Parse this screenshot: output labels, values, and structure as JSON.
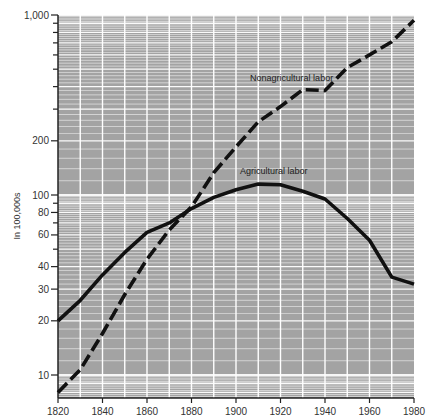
{
  "chart_data": {
    "type": "line",
    "title": "",
    "xlabel": "",
    "ylabel": "In 100,000s",
    "yscale": "log",
    "ylim": [
      7.45,
      1000
    ],
    "xlim": [
      1820,
      1980
    ],
    "grid": true,
    "x": [
      1820,
      1830,
      1840,
      1850,
      1860,
      1870,
      1880,
      1890,
      1900,
      1910,
      1920,
      1930,
      1940,
      1950,
      1960,
      1970,
      1980
    ],
    "x_ticks": [
      1820,
      1840,
      1860,
      1880,
      1900,
      1920,
      1940,
      1960,
      1980
    ],
    "y_ticks": [
      {
        "value": 1000,
        "label": "1,000"
      },
      {
        "value": 200,
        "label": "200"
      },
      {
        "value": 100,
        "label": "100"
      },
      {
        "value": 80,
        "label": "80"
      },
      {
        "value": 60,
        "label": "60"
      },
      {
        "value": 40,
        "label": "40"
      },
      {
        "value": 30,
        "label": "30"
      },
      {
        "value": 20,
        "label": "20"
      },
      {
        "value": 10,
        "label": "10"
      }
    ],
    "y_minor_ticks": [
      900,
      800,
      700,
      600,
      500,
      400,
      300,
      90,
      70,
      50
    ],
    "series": [
      {
        "name": "Nonagricultural labor",
        "style": "dashed",
        "values": [
          8,
          10.7,
          17,
          28,
          44,
          64,
          86,
          133,
          185,
          255,
          310,
          385,
          380,
          510,
          600,
          710,
          935
        ],
        "label_position": {
          "x": 1925,
          "y": 430
        }
      },
      {
        "name": "Agricultural labor",
        "style": "solid",
        "values": [
          20,
          26,
          36,
          48,
          62,
          70,
          84,
          97,
          107,
          115,
          114,
          105,
          95,
          74,
          56,
          35,
          32
        ],
        "label_position": {
          "x": 1917,
          "y": 130
        }
      }
    ],
    "legend": "inline labels"
  },
  "colors": {
    "plot_background": "#a3a3a3",
    "gridline": "#ffffff",
    "line": "#111111",
    "axis": "#222222"
  }
}
